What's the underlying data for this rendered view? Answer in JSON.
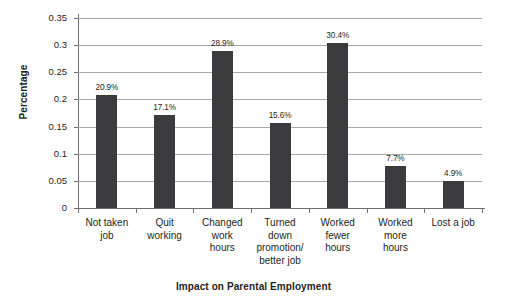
{
  "chart_data": {
    "type": "bar",
    "title": "",
    "xlabel": "Impact on Parental Employment",
    "ylabel": "Percentage",
    "categories": [
      "Not taken job",
      "Quit working",
      "Changed work hours",
      "Turned down promotion/ better job",
      "Worked fewer hours",
      "Worked more hours",
      "Lost a job"
    ],
    "category_lines": [
      [
        "Not taken",
        "job"
      ],
      [
        "Quit",
        "working"
      ],
      [
        "Changed",
        "work",
        "hours"
      ],
      [
        "Turned",
        "down",
        "promotion/",
        "better job"
      ],
      [
        "Worked",
        "fewer",
        "hours"
      ],
      [
        "Worked",
        "more",
        "hours"
      ],
      [
        "Lost a job"
      ]
    ],
    "values": [
      0.209,
      0.171,
      0.289,
      0.156,
      0.304,
      0.077,
      0.049
    ],
    "data_labels": [
      "20.9%",
      "17.1%",
      "28.9%",
      "15.6%",
      "30.4%",
      "7.7%",
      "4.9%"
    ],
    "ylim": [
      0,
      0.35
    ],
    "yticks": [
      0,
      0.05,
      0.1,
      0.15,
      0.2,
      0.25,
      0.3,
      0.35
    ],
    "ytick_labels": [
      "0",
      "0.05",
      "0.1",
      "0.15",
      "0.2",
      "0.25",
      "0.3",
      "0.35"
    ],
    "grid": true,
    "legend": false,
    "bar_color": "#3b3b3d",
    "grid_color": "#a7a9ac",
    "axis_color": "#6d6e71",
    "background": "#ffffff"
  }
}
